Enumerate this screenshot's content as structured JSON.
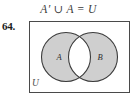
{
  "exercise": {
    "number": "64.",
    "equation": "A′ ∪ A = U"
  },
  "diagram": {
    "type": "venn-two-set",
    "universe_label": "U",
    "set_a_label": "A",
    "set_b_label": "B",
    "shaded_regions": [
      "A only",
      "B only"
    ],
    "unshaded_regions": [
      "A ∩ B"
    ],
    "colors": {
      "shade_fill": "#cfcfcf",
      "unshaded_fill": "#ffffff",
      "outline": "#3c3c3c",
      "box_outline": "#4a4a4a",
      "text": "#2e2e2e",
      "page_background": "#ffffff"
    }
  }
}
